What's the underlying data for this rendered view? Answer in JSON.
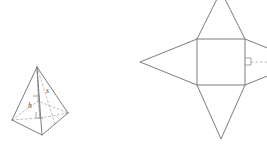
{
  "figure": {
    "background_color": "#ffffff",
    "stroke_color": "#6e6e6e",
    "hidden_stroke_color": "#a8a8a8",
    "labels": {
      "slant_height": "s",
      "height": "h"
    },
    "pyramid": {
      "name": "square-pyramid-solid",
      "apex": {
        "x": 37,
        "y": 67
      },
      "base_corners": [
        {
          "x": 12,
          "y": 120
        },
        {
          "x": 42,
          "y": 135
        },
        {
          "x": 68,
          "y": 113
        },
        {
          "x": 38,
          "y": 101
        }
      ],
      "base_center": {
        "x": 40,
        "y": 118
      },
      "visible_edges": 5,
      "hidden_edges": 3,
      "right_angle_marks": 2
    },
    "net": {
      "name": "square-pyramid-net",
      "square": {
        "x": 197,
        "y": 39,
        "width": 48,
        "height": 46
      },
      "triangles": [
        {
          "name": "net-triangle-top",
          "apex": {
            "x": 221,
            "y": -8
          }
        },
        {
          "name": "net-triangle-bottom",
          "apex": {
            "x": 221,
            "y": 139
          }
        },
        {
          "name": "net-triangle-left",
          "apex": {
            "x": 140,
            "y": 62
          }
        },
        {
          "name": "net-triangle-right",
          "apex": {
            "x": 300,
            "y": 62
          }
        }
      ],
      "right_angle_marks": 1,
      "dashed_segments": 1
    }
  }
}
